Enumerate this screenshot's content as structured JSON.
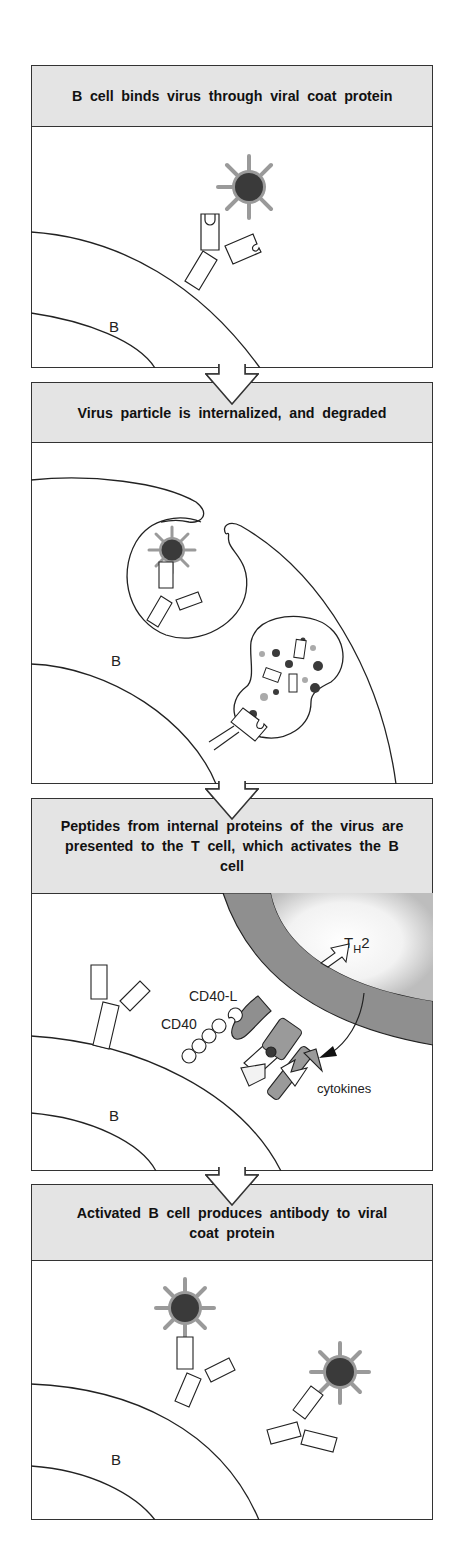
{
  "figure": {
    "panels": [
      {
        "title": "B cell binds virus through viral coat protein",
        "labels": {
          "cell": "B"
        }
      },
      {
        "title": "Virus particle is internalized, and degraded",
        "labels": {
          "cell": "B"
        }
      },
      {
        "title": "Peptides from internal proteins of the virus are presented to the T cell, which activates the B cell",
        "labels": {
          "cell": "B",
          "t_cell": "T",
          "t_cell_sub": "H",
          "t_cell_suffix": "2",
          "cd40l": "CD40-L",
          "cd40": "CD40",
          "cytokines": "cytokines"
        }
      },
      {
        "title": "Activated B cell produces antibody to viral coat protein",
        "labels": {
          "cell": "B"
        }
      }
    ],
    "colors": {
      "header_bg": "#e4e4e4",
      "outline": "#333333",
      "virus_core": "#3a3a3a",
      "virus_coat": "#9a9a9a",
      "t_cell_membrane": "#8f8f8f",
      "mhc_fill": "#9a9a9a"
    }
  }
}
